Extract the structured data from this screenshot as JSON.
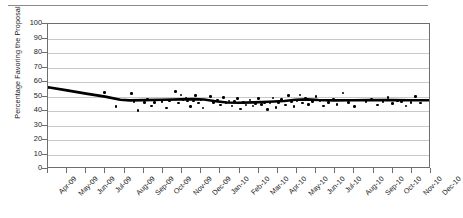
{
  "chart_data": {
    "type": "scatter",
    "title": "",
    "xlabel": "",
    "ylabel": "Percentage Favoring the Proposal",
    "ylim": [
      0,
      100
    ],
    "ytick_labels": [
      "0",
      "10",
      "20",
      "30",
      "40",
      "50",
      "60",
      "70",
      "80",
      "90",
      "100"
    ],
    "ytick_values": [
      0,
      10,
      20,
      30,
      40,
      50,
      60,
      70,
      80,
      90,
      100
    ],
    "grid": true,
    "legend": "none",
    "categories": [
      "Apr-09",
      "May-09",
      "Jun-09",
      "Jul-09",
      "Aug-09",
      "Sep-09",
      "Oct-09",
      "Nov-09",
      "Dec-09",
      "Jan-10",
      "Feb-10",
      "Mar-10",
      "Apr-10",
      "May-10",
      "Jun-10",
      "Jul-10",
      "Aug-10",
      "Sep-10",
      "Oct-10",
      "Nov-10",
      "Dec-10"
    ],
    "series": [
      {
        "name": "Poll results",
        "marker": "filled-circle",
        "color": "#000000",
        "points": [
          [
            0.0,
            55.8
          ],
          [
            2.95,
            52.8
          ],
          [
            3.55,
            43.0
          ],
          [
            4.35,
            52.0
          ],
          [
            4.5,
            46.5
          ],
          [
            4.7,
            40.5
          ],
          [
            5.05,
            46.0
          ],
          [
            5.2,
            48.0
          ],
          [
            5.4,
            43.5
          ],
          [
            5.55,
            46.0
          ],
          [
            5.95,
            46.5
          ],
          [
            6.2,
            42.0
          ],
          [
            6.35,
            47.0
          ],
          [
            6.65,
            53.5
          ],
          [
            6.8,
            45.5
          ],
          [
            6.95,
            51.0
          ],
          [
            7.05,
            47.5
          ],
          [
            7.2,
            48.5
          ],
          [
            7.3,
            47.0
          ],
          [
            7.45,
            43.0
          ],
          [
            7.6,
            47.0
          ],
          [
            7.7,
            50.5
          ],
          [
            7.85,
            45.5
          ],
          [
            8.0,
            47.5
          ],
          [
            8.1,
            42.0
          ],
          [
            8.3,
            47.5
          ],
          [
            8.5,
            50.0
          ],
          [
            8.65,
            46.0
          ],
          [
            8.85,
            47.5
          ],
          [
            9.0,
            44.0
          ],
          [
            9.15,
            49.5
          ],
          [
            9.3,
            45.5
          ],
          [
            9.45,
            47.0
          ],
          [
            9.6,
            43.5
          ],
          [
            9.75,
            46.5
          ],
          [
            9.9,
            48.5
          ],
          [
            10.05,
            41.5
          ],
          [
            10.2,
            46.0
          ],
          [
            10.35,
            44.0
          ],
          [
            10.55,
            47.5
          ],
          [
            10.7,
            43.5
          ],
          [
            10.85,
            45.0
          ],
          [
            11.0,
            48.5
          ],
          [
            11.15,
            44.5
          ],
          [
            11.3,
            46.0
          ],
          [
            11.45,
            41.0
          ],
          [
            11.6,
            45.5
          ],
          [
            11.75,
            49.0
          ],
          [
            11.9,
            42.5
          ],
          [
            12.05,
            46.0
          ],
          [
            12.2,
            48.0
          ],
          [
            12.4,
            44.0
          ],
          [
            12.55,
            50.5
          ],
          [
            12.7,
            46.5
          ],
          [
            12.85,
            43.0
          ],
          [
            13.0,
            47.0
          ],
          [
            13.15,
            51.0
          ],
          [
            13.3,
            45.5
          ],
          [
            13.45,
            48.5
          ],
          [
            13.6,
            44.5
          ],
          [
            13.8,
            46.5
          ],
          [
            14.0,
            50.0
          ],
          [
            14.2,
            47.0
          ],
          [
            14.4,
            43.5
          ],
          [
            14.65,
            46.0
          ],
          [
            14.9,
            48.0
          ],
          [
            15.1,
            44.5
          ],
          [
            15.4,
            52.5
          ],
          [
            15.7,
            46.0
          ],
          [
            16.0,
            43.0
          ],
          [
            16.3,
            47.5
          ],
          [
            16.6,
            46.5
          ],
          [
            16.9,
            48.0
          ],
          [
            17.2,
            44.0
          ],
          [
            17.5,
            46.5
          ],
          [
            17.75,
            49.5
          ],
          [
            18.0,
            45.0
          ],
          [
            18.25,
            47.0
          ],
          [
            18.45,
            46.5
          ],
          [
            18.7,
            43.5
          ],
          [
            18.95,
            46.0
          ],
          [
            19.2,
            50.0
          ],
          [
            19.45,
            45.5
          ],
          [
            19.7,
            47.5
          ],
          [
            19.95,
            44.5
          ],
          [
            20.15,
            48.5
          ],
          [
            20.35,
            46.0
          ],
          [
            20.6,
            47.0
          ],
          [
            20.8,
            44.0
          ]
        ]
      }
    ],
    "trend_line": {
      "name": "Moving average",
      "color": "#000000",
      "width_px": 2.6,
      "points": [
        [
          0.0,
          55.8
        ],
        [
          1.0,
          53.6
        ],
        [
          2.0,
          51.3
        ],
        [
          3.0,
          49.2
        ],
        [
          3.8,
          47.0
        ],
        [
          4.3,
          46.6
        ],
        [
          5.0,
          46.8
        ],
        [
          6.0,
          47.0
        ],
        [
          7.0,
          47.3
        ],
        [
          7.6,
          47.5
        ],
        [
          8.2,
          47.2
        ],
        [
          8.8,
          46.0
        ],
        [
          9.4,
          45.1
        ],
        [
          10.0,
          44.9
        ],
        [
          10.8,
          45.2
        ],
        [
          11.6,
          45.6
        ],
        [
          12.4,
          46.2
        ],
        [
          13.0,
          47.0
        ],
        [
          13.6,
          47.3
        ],
        [
          14.2,
          46.9
        ],
        [
          15.0,
          46.6
        ],
        [
          16.0,
          46.7
        ],
        [
          17.0,
          46.8
        ],
        [
          18.0,
          46.8
        ],
        [
          19.0,
          46.7
        ],
        [
          20.0,
          46.7
        ],
        [
          20.8,
          46.6
        ]
      ]
    }
  }
}
